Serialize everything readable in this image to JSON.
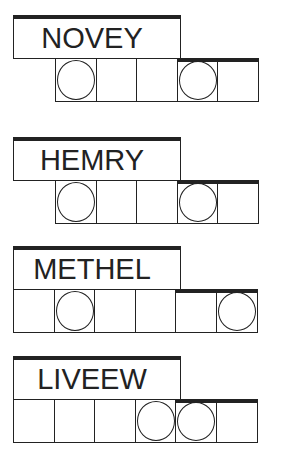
{
  "puzzles": [
    {
      "scrambled": "NOVEY",
      "length": 5,
      "circled": [
        0,
        3
      ]
    },
    {
      "scrambled": "HEMRY",
      "length": 5,
      "circled": [
        0,
        3
      ]
    },
    {
      "scrambled": "METHEL",
      "length": 6,
      "circled": [
        1,
        5
      ]
    },
    {
      "scrambled": "LIVEEW",
      "length": 6,
      "circled": [
        3,
        4
      ]
    }
  ]
}
